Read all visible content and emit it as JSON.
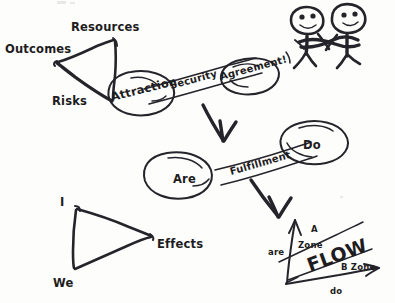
{
  "page": {
    "background_color": "#fdfdfc",
    "ink_color": "#25242a",
    "width": 395,
    "height": 303
  },
  "diagram": {
    "kind": "hand-drawn-whiteboard-sketch",
    "groups": [
      {
        "name": "outcomes-triangle",
        "shape": "triangle",
        "vertex_labels": [
          "Outcomes",
          "Resources",
          "Risks"
        ]
      },
      {
        "name": "attraction-chain",
        "shape": "two-ellipses-joined-by-band",
        "node_labels": [
          "Attraction",
          "Agreement!"
        ],
        "band_label": "Security"
      },
      {
        "name": "are-do-chain",
        "shape": "two-ellipses-joined-by-band",
        "node_labels": [
          "Are",
          "Do"
        ],
        "band_label": "Fulfillment"
      },
      {
        "name": "handshake-figures",
        "shape": "two-stick-figures-shaking-hands",
        "figure_count": 2
      },
      {
        "name": "effects-triangle",
        "shape": "triangle",
        "vertex_labels": [
          "I",
          "We",
          "Effects"
        ]
      },
      {
        "name": "flow-axes",
        "shape": "two-axes-with-diagonal",
        "headline": "FLOW",
        "axis_labels": [
          "are",
          "do"
        ],
        "zone_labels": [
          "A Zone",
          "B Zone"
        ]
      }
    ]
  },
  "labels": {
    "outcomes": "Outcomes",
    "resources": "Resources",
    "risks": "Risks",
    "attraction": "Attraction",
    "security": "Security",
    "agreement": "Agreement!",
    "are": "Are",
    "fulfillment": "Fulfillment",
    "do": "Do",
    "i": "I",
    "we": "We",
    "effects": "Effects",
    "flow": "FLOW",
    "axis_are": "are",
    "axis_do": "do",
    "zone_a_line1": "A",
    "zone_a_line2": "Zone",
    "zone_b": "B Zone"
  }
}
